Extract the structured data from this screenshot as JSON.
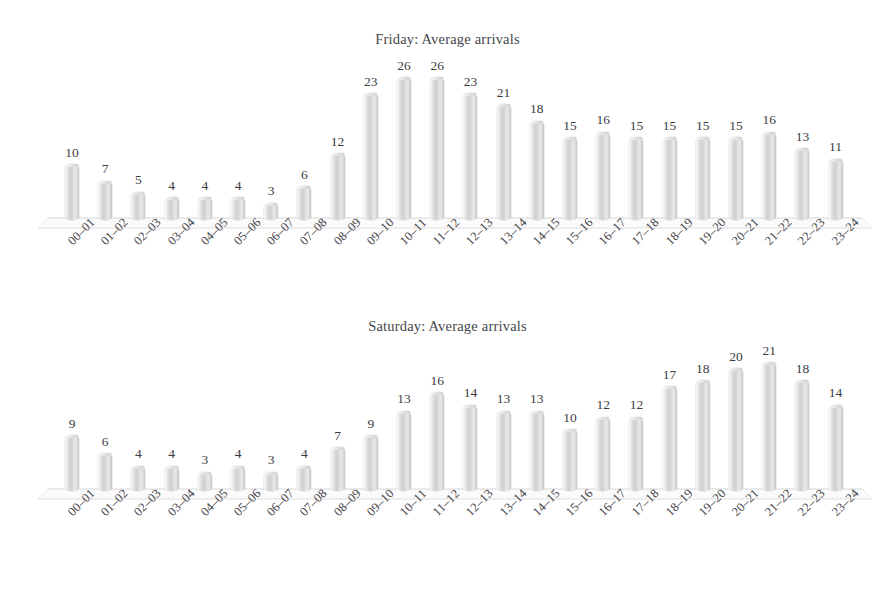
{
  "document": {
    "background_color": "#ffffff",
    "text_color": "#3c3c3c",
    "bar_color": "#d8d8d8"
  },
  "charts": [
    {
      "id": "friday",
      "title": "Friday: Average arrivals"
    },
    {
      "id": "saturday",
      "title": "Saturday: Average arrivals"
    }
  ],
  "chart_data": [
    {
      "type": "bar",
      "title": "Friday: Average arrivals",
      "xlabel": "",
      "ylabel": "",
      "ylim": [
        0,
        26
      ],
      "grid": false,
      "legend": "none",
      "style": "3d-cylinder",
      "data_labels": true,
      "categories": [
        "00–01",
        "01–02",
        "02–03",
        "03–04",
        "04–05",
        "05–06",
        "06–07",
        "07–08",
        "08–09",
        "09–10",
        "10–11",
        "11–12",
        "12–13",
        "13–14",
        "14–15",
        "15–16",
        "16–17",
        "17–18",
        "18–19",
        "19–20",
        "20–21",
        "21–22",
        "22–23",
        "23–24"
      ],
      "values": [
        10,
        7,
        5,
        4,
        4,
        4,
        3,
        6,
        12,
        23,
        26,
        26,
        23,
        21,
        18,
        15,
        16,
        15,
        15,
        15,
        15,
        16,
        13,
        11
      ]
    },
    {
      "type": "bar",
      "title": "Saturday: Average arrivals",
      "xlabel": "",
      "ylabel": "",
      "ylim": [
        0,
        21
      ],
      "grid": false,
      "legend": "none",
      "style": "3d-cylinder",
      "data_labels": true,
      "categories": [
        "00–01",
        "01–02",
        "02–03",
        "03–04",
        "04–05",
        "05–06",
        "06–07",
        "07–08",
        "08–09",
        "09–10",
        "10–11",
        "11–12",
        "12–13",
        "13–14",
        "14–15",
        "15–16",
        "16–17",
        "17–18",
        "18–19",
        "19–20",
        "20–21",
        "21–22",
        "22–23",
        "23–24"
      ],
      "values": [
        9,
        6,
        4,
        4,
        3,
        4,
        3,
        4,
        7,
        9,
        13,
        16,
        14,
        13,
        13,
        10,
        12,
        12,
        17,
        18,
        20,
        21,
        18,
        14
      ]
    }
  ]
}
